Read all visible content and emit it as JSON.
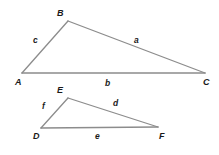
{
  "figure": {
    "background_color": "#ffffff",
    "stroke_color": "#8c8c8c",
    "label_color": "#1a1a1a",
    "stroke_width": 1.3
  },
  "triangles": [
    {
      "name": "triangle-abc",
      "vertices": [
        {
          "id": "A",
          "label": "A",
          "x": 22,
          "y": 73,
          "label_x": 15,
          "label_y": 85
        },
        {
          "id": "B",
          "label": "B",
          "x": 68,
          "y": 21,
          "label_x": 57,
          "label_y": 16
        },
        {
          "id": "C",
          "label": "C",
          "x": 205,
          "y": 73,
          "label_x": 203,
          "label_y": 85
        }
      ],
      "sides": [
        {
          "id": "a",
          "label": "a",
          "from": "B",
          "to": "C",
          "label_x": 134,
          "label_y": 43
        },
        {
          "id": "b",
          "label": "b",
          "from": "A",
          "to": "C",
          "label_x": 105,
          "label_y": 86
        },
        {
          "id": "c",
          "label": "c",
          "from": "A",
          "to": "B",
          "label_x": 33,
          "label_y": 43
        }
      ]
    },
    {
      "name": "triangle-def",
      "vertices": [
        {
          "id": "D",
          "label": "D",
          "x": 41,
          "y": 128,
          "label_x": 33,
          "label_y": 139
        },
        {
          "id": "E",
          "label": "E",
          "x": 68,
          "y": 98,
          "label_x": 57,
          "label_y": 93
        },
        {
          "id": "F",
          "label": "F",
          "x": 158,
          "y": 127,
          "label_x": 159,
          "label_y": 139
        }
      ],
      "sides": [
        {
          "id": "d",
          "label": "d",
          "from": "E",
          "to": "F",
          "label_x": 113,
          "label_y": 106
        },
        {
          "id": "e",
          "label": "e",
          "from": "D",
          "to": "F",
          "label_x": 95,
          "label_y": 139
        },
        {
          "id": "f",
          "label": "f",
          "from": "D",
          "to": "E",
          "label_x": 42,
          "label_y": 109
        }
      ]
    }
  ]
}
